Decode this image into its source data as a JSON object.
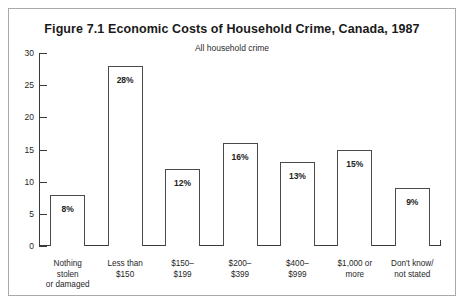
{
  "figure": {
    "title": "Figure 7.1   Economic Costs of Household Crime, Canada, 1987",
    "subtitle": "All household crime"
  },
  "chart_data": {
    "type": "bar",
    "title": "Figure 7.1   Economic Costs of Household Crime, Canada, 1987",
    "subtitle": "All household crime",
    "xlabel": "",
    "ylabel": "",
    "ylim": [
      0,
      30
    ],
    "yticks": [
      0,
      5,
      10,
      15,
      20,
      25,
      30
    ],
    "ytick_labels": [
      "0",
      "5",
      "10",
      "15",
      "20",
      "25",
      "30"
    ],
    "grid": false,
    "legend": false,
    "categories": [
      "Nothing stolen or damaged",
      "Less than $150",
      "$150–$199",
      "$200–$399",
      "$400–$999",
      "$1,000 or more",
      "Don't know/ not stated"
    ],
    "category_lines": [
      [
        "Nothing",
        "stolen",
        "or damaged"
      ],
      [
        "Less than",
        "$150"
      ],
      [
        "$150–",
        "$199"
      ],
      [
        "$200–",
        "$399"
      ],
      [
        "$400–",
        "$999"
      ],
      [
        "$1,000 or",
        "more"
      ],
      [
        "Don't know/",
        "not stated"
      ]
    ],
    "values": [
      8,
      28,
      12,
      16,
      13,
      15,
      9
    ],
    "value_labels": [
      "8%",
      "28%",
      "12%",
      "16%",
      "13%",
      "15%",
      "9%"
    ],
    "bar_fill": "#ffffff",
    "bar_edge": "#4a4a4a",
    "axis_color": "#3a3a3a"
  }
}
